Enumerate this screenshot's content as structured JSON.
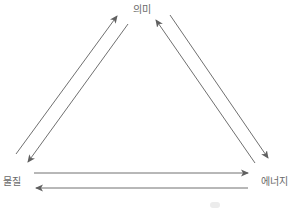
{
  "diagram": {
    "nodes": [
      {
        "id": "meaning",
        "label": "의미",
        "x": 142,
        "y": 8
      },
      {
        "id": "matter",
        "label": "물질",
        "x": 12,
        "y": 180
      },
      {
        "id": "energy",
        "label": "에너지",
        "x": 274,
        "y": 180
      }
    ],
    "edges": [
      {
        "from": "matter",
        "to": "meaning",
        "x1": 16,
        "y1": 154,
        "x2": 117,
        "y2": 16
      },
      {
        "from": "meaning",
        "to": "matter",
        "x1": 128,
        "y1": 24,
        "x2": 28,
        "y2": 162
      },
      {
        "from": "energy",
        "to": "meaning",
        "x1": 255,
        "y1": 163,
        "x2": 156,
        "y2": 20
      },
      {
        "from": "meaning",
        "to": "energy",
        "x1": 170,
        "y1": 15,
        "x2": 268,
        "y2": 158
      },
      {
        "from": "matter",
        "to": "energy",
        "x1": 34,
        "y1": 173,
        "x2": 248,
        "y2": 173
      },
      {
        "from": "energy",
        "to": "matter",
        "x1": 248,
        "y1": 188,
        "x2": 36,
        "y2": 188
      }
    ],
    "colors": {
      "line": "#707070",
      "text": "#6a6a6a"
    }
  }
}
